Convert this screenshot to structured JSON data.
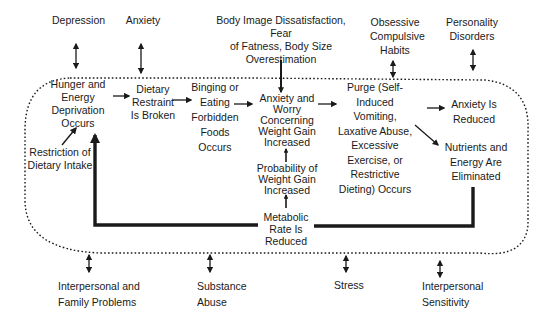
{
  "diagram": {
    "outer_factors_top": {
      "depression": "Depression",
      "anxiety": "Anxiety",
      "body_image": "Body Image Dissatisfaction, Fear\nof Fatness, Body Size\nOverestimation",
      "ocd": "Obsessive\nCompulsive\nHabits",
      "personality": "Personality\nDisorders"
    },
    "outer_factors_bottom": {
      "interpersonal_family": "Interpersonal and\nFamily Problems",
      "substance": "Substance\nAbuse",
      "stress": "Stress",
      "sensitivity": "Interpersonal\nSensitivity"
    },
    "cycle_nodes": {
      "hunger": "Hunger and\nEnergy\nDeprivation\nOccurs",
      "restriction": "Restriction of\nDietary Intake",
      "restraint_broken": "Dietary\nRestraint\nIs Broken",
      "binging": "Binging or\nEating\nForbidden\nFoods\nOccurs",
      "anxiety_worry": "Anxiety and\nWorry\nConcerning\nWeight Gain\nIncreased",
      "probability": "Probability of\nWeight Gain\nIncreased",
      "metabolic": "Metabolic\nRate Is\nReduced",
      "purge": "Purge (Self-\nInduced\nVomiting,\nLaxative Abuse,\nExcessive\nExercise, or\nRestrictive\nDieting) Occurs",
      "anxiety_reduced": "Anxiety Is\nReduced",
      "nutrients": "Nutrients and\nEnergy Are\nEliminated"
    },
    "colors": {
      "ink": "#1a1a1a",
      "background": "#ffffff"
    }
  }
}
